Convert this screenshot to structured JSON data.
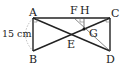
{
  "diagram": {
    "type": "geometry",
    "points": {
      "A": {
        "label": "A",
        "x": 33,
        "y": 18
      },
      "B": {
        "label": "B",
        "x": 33,
        "y": 51
      },
      "C": {
        "label": "C",
        "x": 110,
        "y": 18
      },
      "D": {
        "label": "D",
        "x": 110,
        "y": 51
      },
      "E": {
        "label": "E",
        "x": 71,
        "y": 35
      },
      "F": {
        "label": "F",
        "x": 74,
        "y": 18
      },
      "H": {
        "label": "H",
        "x": 84,
        "y": 18
      },
      "G": {
        "label": "G",
        "x": 84,
        "y": 29
      }
    },
    "measurements": {
      "AB": "15 cm"
    },
    "colors": {
      "line": "#222222",
      "thin_line": "#555555",
      "dashed_arc": "#999999"
    }
  }
}
